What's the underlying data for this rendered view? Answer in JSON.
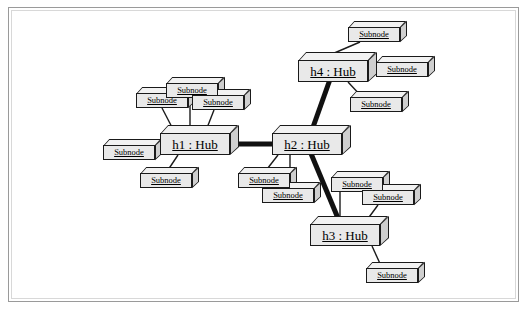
{
  "diagram": {
    "type": "uml-object-diagram",
    "colors": {
      "node_fill": "#e9e9e9",
      "node_top": "#f2f2f2",
      "node_side": "#cfcfcf",
      "node_stroke": "#1a1a1a",
      "hub_link": "#111111",
      "sub_link": "#1a1a1a",
      "frame_border": "#9a9a9a",
      "background": "#ffffff"
    },
    "hubs": [
      {
        "id": "h1",
        "label": "h1 : Hub",
        "x": 160,
        "y": 133
      },
      {
        "id": "h2",
        "label": "h2 : Hub",
        "x": 272,
        "y": 133
      },
      {
        "id": "h3",
        "label": "h3 : Hub",
        "x": 310,
        "y": 224
      },
      {
        "id": "h4",
        "label": "h4 : Hub",
        "x": 298,
        "y": 60
      }
    ],
    "subnodes": [
      {
        "id": "s1",
        "label": "Subnode",
        "x": 136,
        "y": 93,
        "hub": "h1"
      },
      {
        "id": "s2",
        "label": "Subnode",
        "x": 166,
        "y": 83,
        "hub": "h1"
      },
      {
        "id": "s3",
        "label": "Subnode",
        "x": 192,
        "y": 95,
        "hub": "h1"
      },
      {
        "id": "s4",
        "label": "Subnode",
        "x": 103,
        "y": 145,
        "hub": "h1"
      },
      {
        "id": "s5",
        "label": "Subnode",
        "x": 140,
        "y": 173,
        "hub": "h1"
      },
      {
        "id": "s6",
        "label": "Subnode",
        "x": 238,
        "y": 173,
        "hub": "h2"
      },
      {
        "id": "s7",
        "label": "Subnode",
        "x": 262,
        "y": 188,
        "hub": "h2"
      },
      {
        "id": "s8",
        "label": "Subnode",
        "x": 348,
        "y": 27,
        "hub": "h4"
      },
      {
        "id": "s9",
        "label": "Subnode",
        "x": 376,
        "y": 62,
        "hub": "h4"
      },
      {
        "id": "s10",
        "label": "Subnode",
        "x": 350,
        "y": 97,
        "hub": "h4"
      },
      {
        "id": "s11",
        "label": "Subnode",
        "x": 331,
        "y": 177,
        "hub": "h3"
      },
      {
        "id": "s12",
        "label": "Subnode",
        "x": 362,
        "y": 190,
        "hub": "h3"
      },
      {
        "id": "s13",
        "label": "Subnode",
        "x": 366,
        "y": 268,
        "hub": "h3"
      }
    ],
    "hub_links": [
      {
        "from": "h1",
        "to": "h2"
      },
      {
        "from": "h2",
        "to": "h4"
      },
      {
        "from": "h2",
        "to": "h3"
      }
    ],
    "sub_links": [
      {
        "hub": "h1",
        "sub": "s1",
        "x1": 175,
        "y1": 133,
        "x2": 162,
        "y2": 108
      },
      {
        "hub": "h1",
        "sub": "s2",
        "x1": 190,
        "y1": 133,
        "x2": 190,
        "y2": 98
      },
      {
        "hub": "h1",
        "sub": "s3",
        "x1": 205,
        "y1": 133,
        "x2": 214,
        "y2": 110
      },
      {
        "hub": "h1",
        "sub": "s4",
        "x1": 160,
        "y1": 148,
        "x2": 155,
        "y2": 152
      },
      {
        "hub": "h1",
        "sub": "s5",
        "x1": 178,
        "y1": 155,
        "x2": 166,
        "y2": 173
      },
      {
        "hub": "h2",
        "sub": "s6",
        "x1": 278,
        "y1": 155,
        "x2": 264,
        "y2": 173
      },
      {
        "hub": "h2",
        "sub": "s7",
        "x1": 290,
        "y1": 155,
        "x2": 290,
        "y2": 188
      },
      {
        "hub": "h4",
        "sub": "s8",
        "x1": 318,
        "y1": 60,
        "x2": 360,
        "y2": 42
      },
      {
        "hub": "h4",
        "sub": "s9",
        "x1": 368,
        "y1": 70,
        "x2": 376,
        "y2": 70
      },
      {
        "hub": "h4",
        "sub": "s10",
        "x1": 348,
        "y1": 82,
        "x2": 362,
        "y2": 97
      },
      {
        "hub": "h3",
        "sub": "s11",
        "x1": 340,
        "y1": 224,
        "x2": 340,
        "y2": 192
      },
      {
        "hub": "h3",
        "sub": "s12",
        "x1": 364,
        "y1": 224,
        "x2": 378,
        "y2": 205
      },
      {
        "hub": "h3",
        "sub": "s13",
        "x1": 372,
        "y1": 246,
        "x2": 382,
        "y2": 268
      }
    ]
  }
}
